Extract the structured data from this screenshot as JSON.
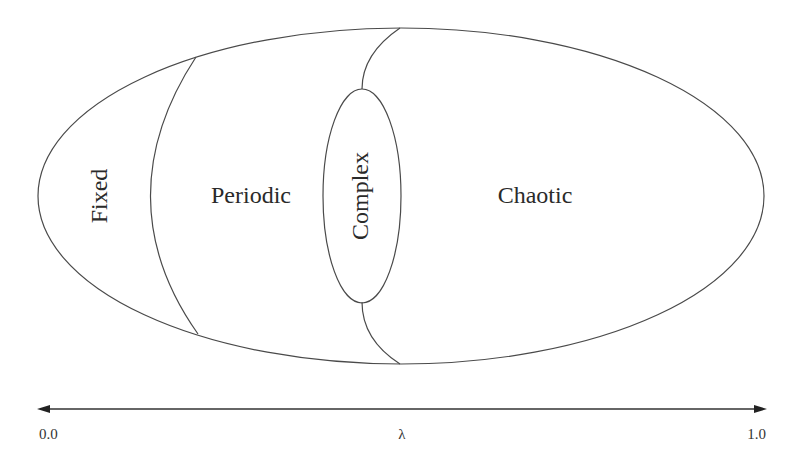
{
  "diagram": {
    "title": "",
    "regions": [
      {
        "id": "fixed",
        "label": "Fixed",
        "orientation": "vertical"
      },
      {
        "id": "periodic",
        "label": "Periodic",
        "orientation": "horizontal"
      },
      {
        "id": "complex",
        "label": "Complex",
        "orientation": "vertical"
      },
      {
        "id": "chaotic",
        "label": "Chaotic",
        "orientation": "horizontal"
      }
    ],
    "axis": {
      "symbol": "λ",
      "min_label": "0.0",
      "max_label": "1.0",
      "arrows": "both"
    },
    "colors": {
      "stroke": "#4a4a4a",
      "text": "#2a2a2a",
      "background": "#ffffff"
    }
  }
}
